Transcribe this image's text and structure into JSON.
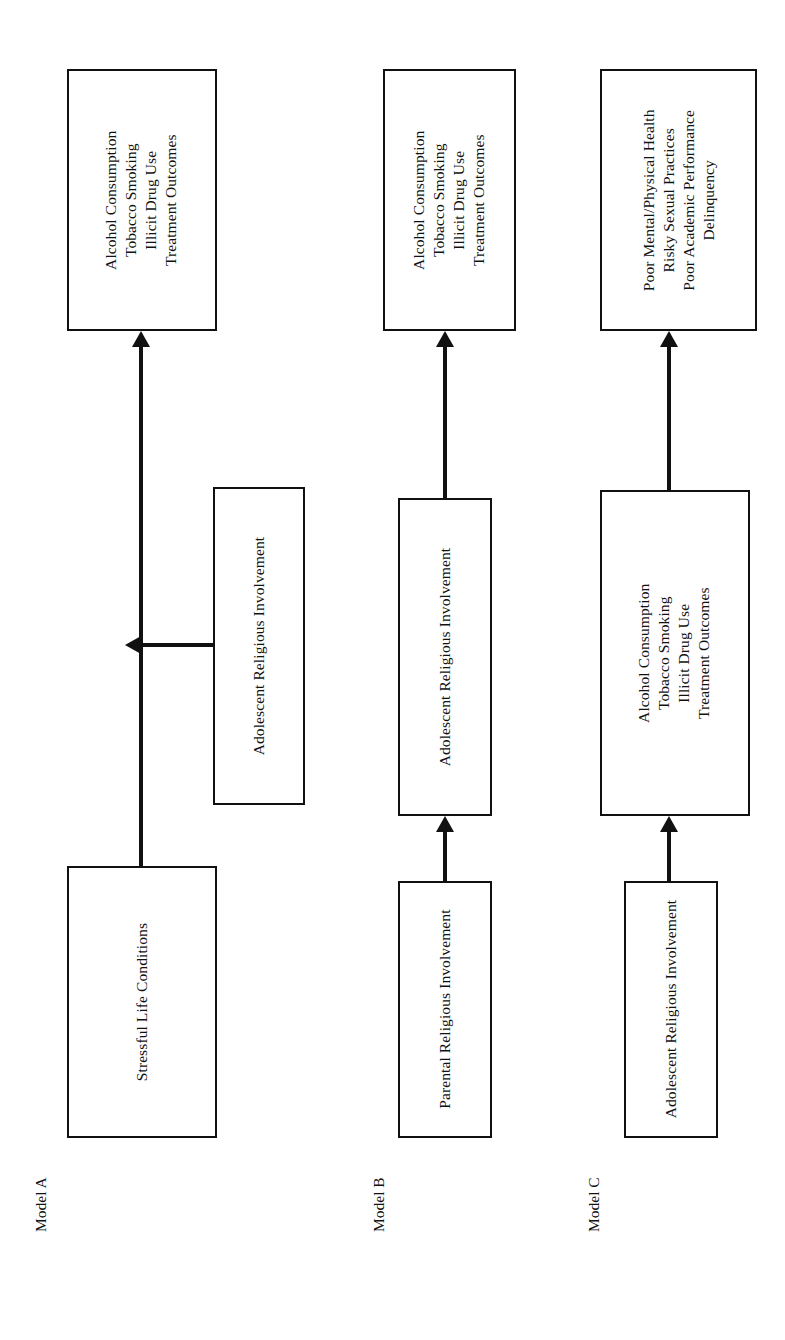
{
  "figure": {
    "orientation": "rotated-90-ccw",
    "background_color": "#ffffff",
    "line_color": "#111111",
    "models": [
      {
        "caption": "Model A",
        "nodes": {
          "outcome": {
            "lines": [
              "Alcohol Consumption",
              "Tobacco Smoking",
              "Illicit Drug Use",
              "Treatment Outcomes"
            ]
          },
          "moderator": {
            "lines": [
              "Adolescent Religious Involvement"
            ]
          },
          "predictor": {
            "lines": [
              "Stressful Life Conditions"
            ]
          }
        }
      },
      {
        "caption": "Model B",
        "nodes": {
          "outcome": {
            "lines": [
              "Alcohol Consumption",
              "Tobacco Smoking",
              "Illicit Drug Use",
              "Treatment Outcomes"
            ]
          },
          "mediator": {
            "lines": [
              "Adolescent Religious Involvement"
            ]
          },
          "predictor": {
            "lines": [
              "Parental Religious Involvement"
            ]
          }
        }
      },
      {
        "caption": "Model C",
        "nodes": {
          "outcome": {
            "lines": [
              "Poor Mental/Physical Health",
              "Risky Sexual Practices",
              "Poor Academic Performance",
              "Delinquency"
            ]
          },
          "mediator": {
            "lines": [
              "Alcohol Consumption",
              "Tobacco Smoking",
              "Illicit Drug Use",
              "Treatment Outcomes"
            ]
          },
          "predictor": {
            "lines": [
              "Adolescent Religious Involvement"
            ]
          }
        }
      }
    ]
  }
}
